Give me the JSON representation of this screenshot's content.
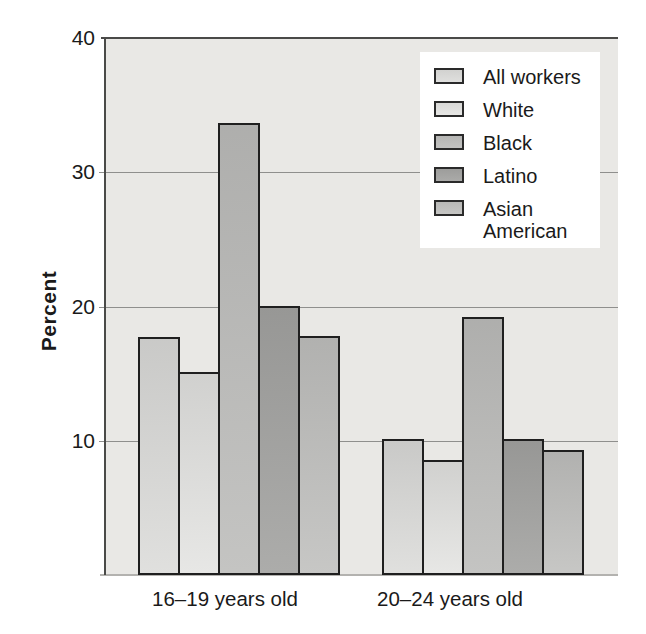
{
  "chart_data": {
    "type": "bar",
    "title": "",
    "categories": [
      "16–19 years old",
      "20–24 years old"
    ],
    "series": [
      {
        "name": "All workers",
        "values": [
          17.7,
          10.1
        ],
        "color": "#dddddb"
      },
      {
        "name": "White",
        "values": [
          15.1,
          8.6
        ],
        "color": "#e5e5e3"
      },
      {
        "name": "Black",
        "values": [
          33.7,
          19.2
        ],
        "color": "#bfbfbd"
      },
      {
        "name": "Latino",
        "values": [
          20.0,
          10.1
        ],
        "color": "#a5a5a3"
      },
      {
        "name": "Asian American",
        "values": [
          17.8,
          9.3
        ],
        "color": "#c2c2c0"
      }
    ],
    "xlabel": "",
    "ylabel": "Percent",
    "ylim": [
      0,
      40
    ],
    "yticks": [
      10,
      20,
      30,
      40
    ],
    "grid": true,
    "legend_position": "upper right"
  },
  "y_axis": {
    "label": "Percent"
  },
  "colors": {
    "plot_bg": "#e9e8e5",
    "axis_line": "#4a4a48",
    "gridline": "#8f8f8d",
    "baseline": "#b3b2af",
    "bar_border": "#1f1f1f",
    "text": "#1a1a1a",
    "legend_bg": "#ffffff"
  }
}
